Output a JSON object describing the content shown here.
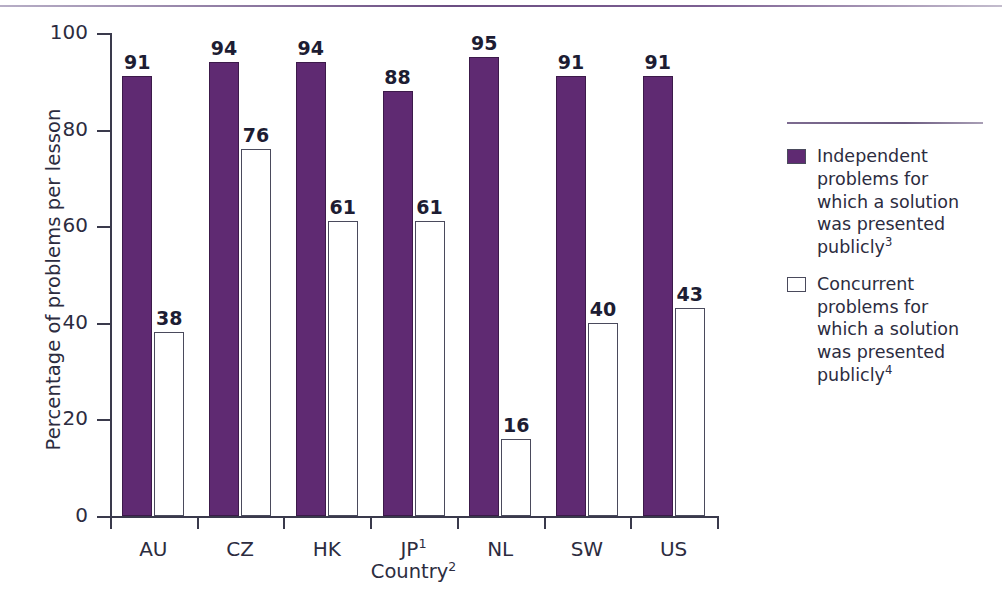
{
  "chart_data": {
    "type": "bar",
    "title": "",
    "xlabel": "Country",
    "xlabel_superscript": "2",
    "ylabel": "Percentage of problems per lesson",
    "ylim": [
      0,
      100
    ],
    "yticks": [
      0,
      20,
      40,
      60,
      80,
      100
    ],
    "grid": false,
    "legend_position": "right",
    "categories": [
      "AU",
      "CZ",
      "HK",
      "JP",
      "NL",
      "SW",
      "US"
    ],
    "category_superscripts": [
      "",
      "",
      "",
      "1",
      "",
      "",
      ""
    ],
    "series": [
      {
        "name": "Independent problems for which a solution was presented publicly",
        "name_superscript": "3",
        "color": "#5f2a72",
        "values": [
          91,
          94,
          94,
          88,
          95,
          91,
          91
        ]
      },
      {
        "name": "Concurrent problems for which a solution was presented publicly",
        "name_superscript": "4",
        "color": "#ffffff",
        "values": [
          38,
          76,
          61,
          61,
          16,
          40,
          43
        ]
      }
    ]
  },
  "legend": {
    "items": [
      {
        "label": "Independent problems for which a solution was presented publicly",
        "superscript": "3",
        "swatch": "independent"
      },
      {
        "label": "Concurrent problems for which a solution was presented publicly",
        "superscript": "4",
        "swatch": "concurrent"
      }
    ]
  },
  "colors": {
    "accent_purple": "#5f2a72",
    "rule_purple": "#6b4d82",
    "axis": "#3a3a4c",
    "text": "#2c2c40",
    "background": "#ffffff"
  }
}
